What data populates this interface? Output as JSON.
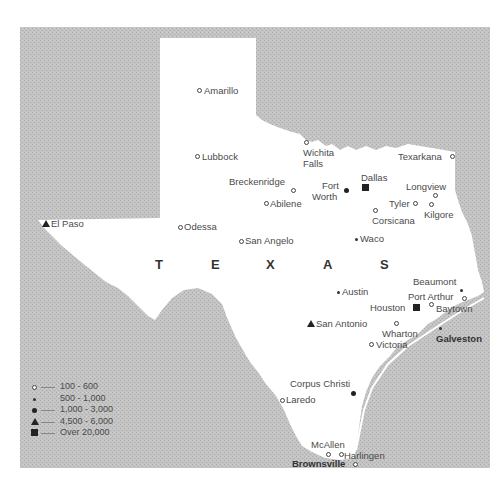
{
  "map": {
    "title": "TEXAS",
    "title_letters": [
      "T",
      "E",
      "X",
      "A",
      "S"
    ],
    "colors": {
      "background_region": "#bdbdbd",
      "state_fill": "#ffffff",
      "marker": "#222222",
      "text": "#4a4a4a"
    },
    "legend": {
      "items": [
        {
          "symbol": "open-circle",
          "range": "100 - 600"
        },
        {
          "symbol": "small-dot",
          "range": "500 - 1,000"
        },
        {
          "symbol": "filled-circle",
          "range": "1,000 - 3,000"
        },
        {
          "symbol": "triangle",
          "range": "4,500 - 6,000"
        },
        {
          "symbol": "square",
          "range": "Over 20,000"
        }
      ]
    },
    "cities": [
      {
        "name": "Amarillo",
        "symbol": "open-circle"
      },
      {
        "name": "Lubbock",
        "symbol": "open-circle"
      },
      {
        "name": "Wichita",
        "name2": "Falls",
        "symbol": "open-circle"
      },
      {
        "name": "Texarkana",
        "symbol": "open-circle"
      },
      {
        "name": "Breckenridge",
        "symbol": "open-circle"
      },
      {
        "name": "Fort",
        "name2": "Worth",
        "symbol": "filled-circle"
      },
      {
        "name": "Dallas",
        "symbol": "square"
      },
      {
        "name": "Longview",
        "symbol": "open-circle"
      },
      {
        "name": "Abilene",
        "symbol": "open-circle"
      },
      {
        "name": "Tyler",
        "symbol": "open-circle"
      },
      {
        "name": "Kilgore",
        "symbol": "open-circle"
      },
      {
        "name": "Corsicana",
        "symbol": "open-circle"
      },
      {
        "name": "El Paso",
        "symbol": "triangle"
      },
      {
        "name": "Odessa",
        "symbol": "open-circle"
      },
      {
        "name": "San Angelo",
        "symbol": "open-circle"
      },
      {
        "name": "Waco",
        "symbol": "small-dot"
      },
      {
        "name": "Beaumont",
        "symbol": "small-dot"
      },
      {
        "name": "Austin",
        "symbol": "small-dot"
      },
      {
        "name": "Port Arthur",
        "symbol": "open-circle"
      },
      {
        "name": "Houston",
        "symbol": "square"
      },
      {
        "name": "Baytown",
        "symbol": "open-circle"
      },
      {
        "name": "San Antonio",
        "symbol": "triangle"
      },
      {
        "name": "Wharton",
        "symbol": "open-circle"
      },
      {
        "name": "Galveston",
        "symbol": "small-dot"
      },
      {
        "name": "Victoria",
        "symbol": "open-circle"
      },
      {
        "name": "Corpus Christi",
        "symbol": "filled-circle"
      },
      {
        "name": "Laredo",
        "symbol": "open-circle"
      },
      {
        "name": "McAllen",
        "symbol": "open-circle"
      },
      {
        "name": "Harlingen",
        "symbol": "open-circle"
      },
      {
        "name": "Brownsville",
        "symbol": "open-circle"
      }
    ]
  }
}
